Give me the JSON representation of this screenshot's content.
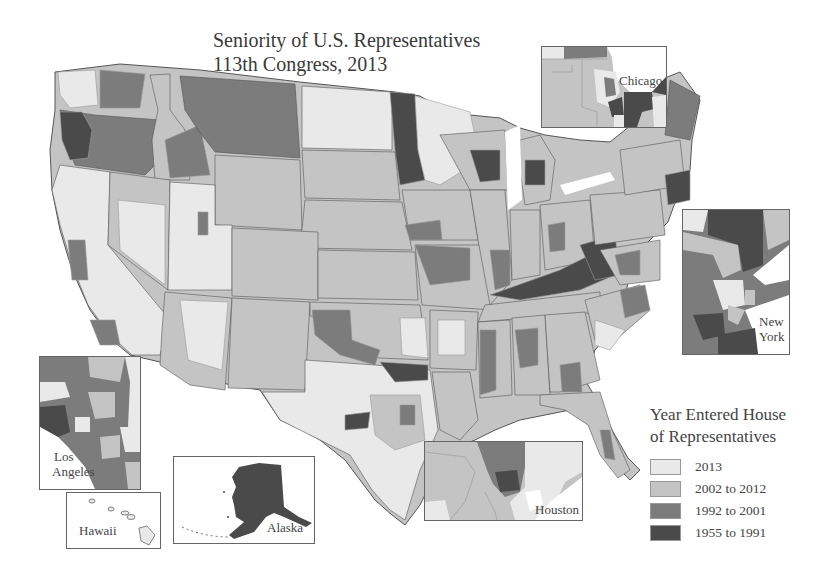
{
  "title": {
    "line1": "Seniority of U.S. Representatives",
    "line2": "113th Congress, 2013"
  },
  "colors": {
    "c2013": "#e9e9e9",
    "c2002_2012": "#c4c4c4",
    "c1992_2001": "#7c7c7c",
    "c1955_1991": "#4a4a4a",
    "border": "#555555",
    "district_border": "#9a9a9a",
    "water": "#ffffff"
  },
  "legend": {
    "title_line1": "Year Entered House",
    "title_line2": "of Representatives",
    "items": [
      {
        "label": "2013",
        "color": "#e9e9e9"
      },
      {
        "label": "2002 to 2012",
        "color": "#c4c4c4"
      },
      {
        "label": "1992 to 2001",
        "color": "#7c7c7c"
      },
      {
        "label": "1955 to 1991",
        "color": "#4a4a4a"
      }
    ]
  },
  "insets": {
    "chicago": {
      "label": "Chicago"
    },
    "new_york": {
      "label_line1": "New",
      "label_line2": "York"
    },
    "los_angeles": {
      "label_line1": "Los",
      "label_line2": "Angeles"
    },
    "hawaii": {
      "label": "Hawaii"
    },
    "alaska": {
      "label": "Alaska"
    },
    "houston": {
      "label": "Houston"
    }
  }
}
